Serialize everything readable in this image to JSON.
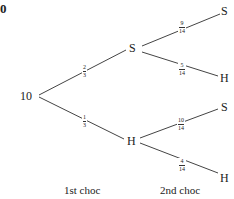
{
  "corner_text": "0",
  "root": {
    "label": "10"
  },
  "first": {
    "upper": {
      "label": "S",
      "prob": {
        "num": "2",
        "den": "3"
      }
    },
    "lower": {
      "label": "H",
      "prob": {
        "num": "1",
        "den": "3"
      }
    }
  },
  "second": {
    "upper_upper": {
      "label": "S",
      "prob": {
        "num": "9",
        "den": "14"
      }
    },
    "upper_lower": {
      "label": "H",
      "prob": {
        "num": "5",
        "den": "14"
      }
    },
    "lower_upper": {
      "label": "S",
      "prob": {
        "num": "10",
        "den": "14"
      }
    },
    "lower_lower": {
      "label": "H",
      "prob": {
        "num": "4",
        "den": "14"
      }
    }
  },
  "stage_labels": {
    "first": "1st choc",
    "second": "2nd choc"
  },
  "colors": {
    "line": "#444444",
    "text": "#222222"
  }
}
